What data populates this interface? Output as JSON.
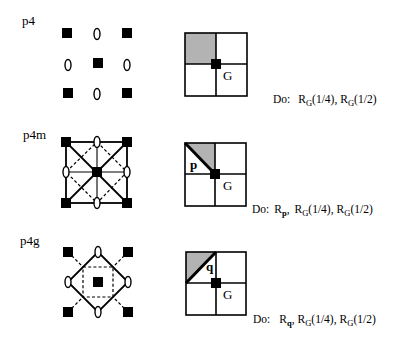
{
  "colors": {
    "ink": "#000000",
    "shade": "#b3b3b3",
    "background": "#ffffff"
  },
  "rows": [
    {
      "label": "p4",
      "grid": {
        "center_label": "G"
      },
      "do": {
        "prefix": "Do:",
        "separator": ",",
        "ops": [
          {
            "base": "R",
            "sub": "G",
            "arg": "(1/4)"
          },
          {
            "base": "R",
            "sub": "G",
            "arg": "(1/2)"
          }
        ]
      }
    },
    {
      "label": "p4m",
      "grid": {
        "center_label": "G",
        "edge_label": "p"
      },
      "do": {
        "prefix": "Do:",
        "separator": ",",
        "ops": [
          {
            "base": "R",
            "sub": "p",
            "arg": ""
          },
          {
            "base": "R",
            "sub": "G",
            "arg": "(1/4)"
          },
          {
            "base": "R",
            "sub": "G",
            "arg": "(1/2)"
          }
        ]
      }
    },
    {
      "label": "p4g",
      "grid": {
        "center_label": "G",
        "edge_label": "q"
      },
      "do": {
        "prefix": "Do:",
        "separator": ",",
        "ops": [
          {
            "base": "R",
            "sub": "q",
            "arg": ""
          },
          {
            "base": "R",
            "sub": "G",
            "arg": "(1/4)"
          },
          {
            "base": "R",
            "sub": "G",
            "arg": "(1/2)"
          }
        ]
      }
    }
  ]
}
